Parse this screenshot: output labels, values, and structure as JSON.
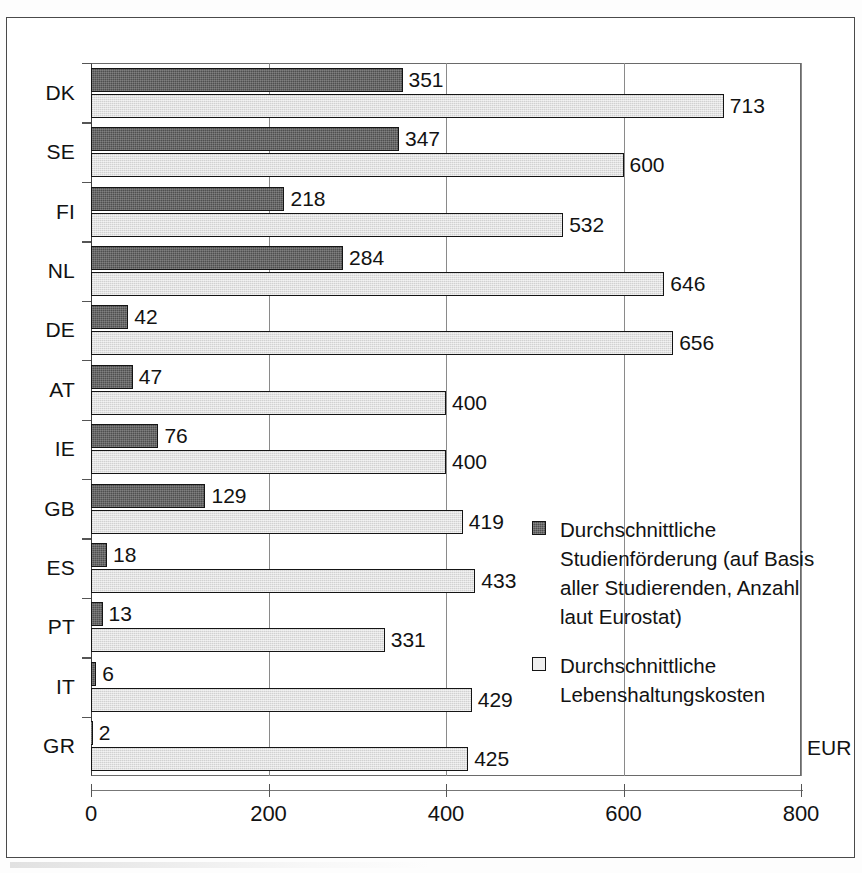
{
  "chart_data": {
    "type": "bar",
    "orientation": "horizontal",
    "title": "",
    "xlabel": "EUR",
    "ylabel": "",
    "xlim": [
      0,
      800
    ],
    "xticks": [
      0,
      200,
      400,
      600,
      800
    ],
    "grid": true,
    "legend_position": "inside-right",
    "categories": [
      "DK",
      "SE",
      "FI",
      "NL",
      "DE",
      "AT",
      "IE",
      "GB",
      "ES",
      "PT",
      "IT",
      "GR"
    ],
    "series": [
      {
        "name": "Durchschnittliche Studienförderung (auf Basis aller Studierenden, Anzahl laut Eurostat)",
        "color": "#4f4f4f",
        "values": [
          351,
          347,
          218,
          284,
          42,
          47,
          76,
          129,
          18,
          13,
          6,
          2
        ]
      },
      {
        "name": "Durchschnittliche Lebenshaltungskosten",
        "color": "#e2e2e2",
        "values": [
          713,
          600,
          532,
          646,
          656,
          400,
          400,
          419,
          433,
          331,
          429,
          425
        ]
      }
    ]
  },
  "axis": {
    "unit_label": "EUR",
    "tick_labels": [
      "0",
      "200",
      "400",
      "600",
      "800"
    ]
  },
  "legend": {
    "entries": [
      {
        "swatch": "dark",
        "label": "Durchschnittliche Studienförderung (auf Basis aller Studierenden, Anzahl laut Eurostat)"
      },
      {
        "swatch": "light",
        "label": "Durchschnittliche Lebenshaltungskosten"
      }
    ]
  }
}
